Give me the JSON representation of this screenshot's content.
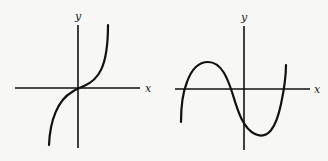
{
  "figure": {
    "panels": [
      {
        "id": "left",
        "description": "Increasing cubic-like curve with inflection at origin",
        "x_label": "x",
        "y_label": "y",
        "origin_px": [
          78,
          88
        ],
        "x_axis_px": [
          15,
          140
        ],
        "y_axis_px": [
          25,
          148
        ],
        "curve_path": "M49,145 C50,120 58,100 72,92 C76,89 80,88 84,86 C98,80 108,68 108,25"
      },
      {
        "id": "right",
        "description": "Cubic with three real roots: rises to a maximum left of y-axis, falls to a minimum right of y-axis, then rises",
        "x_label": "x",
        "y_label": "y",
        "origin_px": [
          244,
          89
        ],
        "x_axis_px": [
          175,
          310
        ],
        "y_axis_px": [
          26,
          150
        ],
        "curve_path": "M181,122 C181,105 183,92 187,82 C192,68 200,62 208,62 C222,62 228,80 232,92 C237,108 242,128 255,134 C268,140 276,128 281,104 C284,90 286,78 286,65"
      }
    ]
  }
}
